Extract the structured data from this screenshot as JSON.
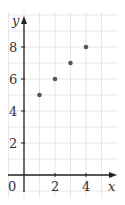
{
  "chart_data": {
    "type": "scatter",
    "title": "",
    "xlabel": "x",
    "ylabel": "y",
    "origin_label": "0",
    "xlim": [
      -1,
      5.5
    ],
    "ylim": [
      -1.5,
      9.5
    ],
    "x_ticks": [
      2,
      4
    ],
    "x_tick_labels": [
      "2",
      "4"
    ],
    "y_ticks": [
      2,
      4,
      6,
      8
    ],
    "y_tick_labels": [
      "2",
      "4",
      "6",
      "8"
    ],
    "grid": true,
    "grid_step_x": 1,
    "grid_step_y": 1,
    "points": [
      {
        "x": 1,
        "y": 5
      },
      {
        "x": 2,
        "y": 6
      },
      {
        "x": 3,
        "y": 7
      },
      {
        "x": 4,
        "y": 8
      }
    ],
    "colors": {
      "grid": "#dddddd",
      "axis": "#222222",
      "point": "#555555",
      "background": "#ffffff"
    }
  }
}
